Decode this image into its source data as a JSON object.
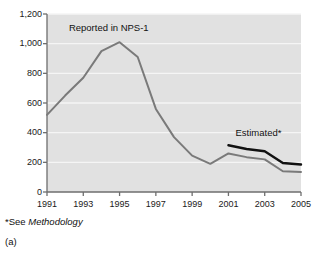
{
  "chart_data": {
    "type": "line",
    "title": "",
    "xlabel": "",
    "ylabel": "",
    "xlim": [
      1991,
      2005
    ],
    "ylim": [
      0,
      1200
    ],
    "grid": true,
    "legend": "none",
    "y_ticks": [
      "0",
      "200",
      "400",
      "600",
      "800",
      "1,000",
      "1,200"
    ],
    "y_tick_values": [
      0,
      200,
      400,
      600,
      800,
      1000,
      1200
    ],
    "x_ticks": [
      "1991",
      "1993",
      "1995",
      "1997",
      "1999",
      "2001",
      "2003",
      "2005"
    ],
    "x_tick_values": [
      1991,
      1993,
      1995,
      1997,
      1999,
      2001,
      2003,
      2005
    ],
    "x_all_years": [
      1991,
      1992,
      1993,
      1994,
      1995,
      1996,
      1997,
      1998,
      1999,
      2000,
      2001,
      2002,
      2003,
      2004,
      2005
    ],
    "series": [
      {
        "name": "Reported in NPS-1",
        "color": "#7a7a7a",
        "x": [
          1991,
          1992,
          1993,
          1994,
          1995,
          1996,
          1997,
          1998,
          1999,
          2000,
          2001,
          2002,
          2003,
          2004,
          2005
        ],
        "values": [
          520,
          650,
          770,
          950,
          1010,
          910,
          560,
          370,
          245,
          190,
          260,
          235,
          220,
          140,
          135
        ]
      },
      {
        "name": "Estimated*",
        "color": "#111111",
        "x": [
          2001,
          2002,
          2003,
          2004,
          2005
        ],
        "values": [
          315,
          290,
          275,
          195,
          185
        ]
      }
    ],
    "annotations": [
      {
        "name": "reported-label",
        "text": "Reported in NPS-1",
        "x": 1993.2,
        "y": 1105
      },
      {
        "name": "estimated-label",
        "text": "Estimated*",
        "x": 2002.6,
        "y": 395
      }
    ]
  },
  "footnotes": {
    "methodology_prefix": "*See ",
    "methodology_term": "Methodology",
    "panel_label": "(a)"
  },
  "colors": {
    "plot_background": "#e1e1e1",
    "gridline": "#f5f5f5",
    "axis": "#6e6e6e",
    "reported_line": "#7a7a7a",
    "estimated_line": "#111111",
    "text": "#1a1a1a"
  }
}
